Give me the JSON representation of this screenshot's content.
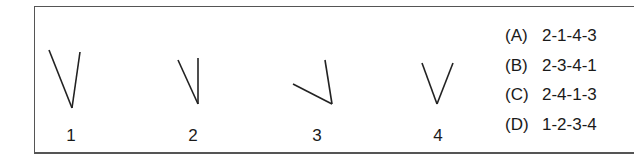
{
  "figures": [
    {
      "label": "1",
      "shape": "angle",
      "lines": [
        [
          49,
          50,
          72,
          108
        ],
        [
          80,
          52,
          72,
          108
        ]
      ],
      "label_x": 71
    },
    {
      "label": "2",
      "shape": "angle",
      "lines": [
        [
          178,
          60,
          198,
          104
        ],
        [
          198,
          58,
          198,
          104
        ]
      ],
      "label_x": 193
    },
    {
      "label": "3",
      "shape": "angle",
      "lines": [
        [
          293,
          84,
          332,
          104
        ],
        [
          325,
          60,
          332,
          104
        ]
      ],
      "label_x": 317
    },
    {
      "label": "4",
      "shape": "angle",
      "lines": [
        [
          422,
          63,
          437,
          104
        ],
        [
          453,
          63,
          437,
          104
        ]
      ],
      "label_x": 438
    }
  ],
  "options": [
    {
      "letter": "(A)",
      "answer": "2-1-4-3"
    },
    {
      "letter": "(B)",
      "answer": "2-3-4-1"
    },
    {
      "letter": "(C)",
      "answer": "2-4-1-3"
    },
    {
      "letter": "(D)",
      "answer": "1-2-3-4"
    }
  ],
  "colors": {
    "line": "#222222",
    "border": "#555555"
  }
}
